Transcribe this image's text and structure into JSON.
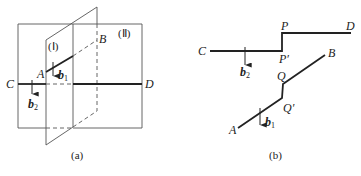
{
  "figure_a": {
    "caption": "(a)",
    "plane_1_label": "(Ⅰ)",
    "plane_2_label": "(Ⅱ)",
    "points": {
      "A": "A",
      "B": "B",
      "C": "C",
      "D": "D"
    },
    "vectors": {
      "b1": {
        "base": "b",
        "sub": "1"
      },
      "b2": {
        "base": "b",
        "sub": "2"
      }
    }
  },
  "figure_b": {
    "caption": "(b)",
    "points": {
      "A": "A",
      "B": "B",
      "C": "C",
      "D": "D",
      "P": "P",
      "P_prime": "P′",
      "Q": "Q",
      "Q_prime": "Q′"
    },
    "vectors": {
      "b1": {
        "base": "b",
        "sub": "1"
      },
      "b2": {
        "base": "b",
        "sub": "2"
      }
    }
  },
  "colors": {
    "line": "#222222",
    "thin_line": "#555555",
    "background": "#ffffff"
  }
}
